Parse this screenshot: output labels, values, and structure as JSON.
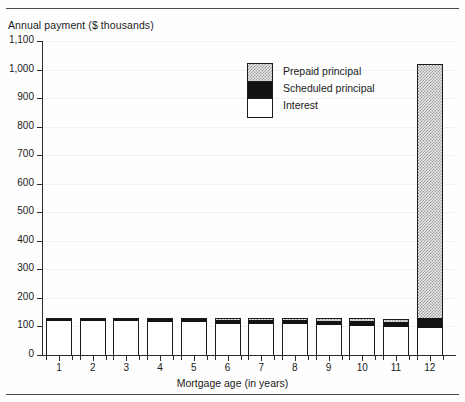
{
  "chart_data": {
    "type": "bar",
    "stacked": true,
    "title": "Annual payment ($ thousands)",
    "xlabel": "Mortgage age (in years)",
    "ylabel": "",
    "categories": [
      "1",
      "2",
      "3",
      "4",
      "5",
      "6",
      "7",
      "8",
      "9",
      "10",
      "11",
      "12"
    ],
    "series": [
      {
        "name": "Interest",
        "color": "#ffffff",
        "values": [
          120,
          119,
          118,
          117,
          116,
          113,
          110,
          107,
          104,
          101,
          98,
          95
        ]
      },
      {
        "name": "Scheduled principal",
        "color": "#121212",
        "values": [
          8,
          9,
          10,
          11,
          12,
          13,
          14,
          15,
          16,
          17,
          18,
          35
        ]
      },
      {
        "name": "Prepaid principal",
        "color": "#e8e8e8",
        "values": [
          0,
          0,
          0,
          0,
          0,
          4,
          7,
          8,
          9,
          10,
          11,
          890
        ]
      }
    ],
    "totals": [
      128,
      128,
      128,
      128,
      128,
      130,
      131,
      130,
      129,
      128,
      127,
      1020
    ],
    "ylim": [
      0,
      1100
    ],
    "ytick_labels": [
      "0",
      "100",
      "200",
      "300",
      "400",
      "500",
      "600",
      "700",
      "800",
      "900",
      "1,000",
      "1,100"
    ],
    "ytick_values": [
      0,
      100,
      200,
      300,
      400,
      500,
      600,
      700,
      800,
      900,
      1000,
      1100
    ],
    "grid": true,
    "legend_position": "upper-center"
  },
  "legend": {
    "entries": [
      {
        "label": "Prepaid principal"
      },
      {
        "label": "Scheduled principal"
      },
      {
        "label": "Interest"
      }
    ]
  }
}
